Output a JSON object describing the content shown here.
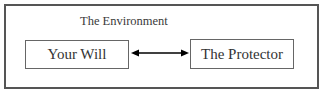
{
  "diagram": {
    "container": {
      "label": "The Environment"
    },
    "nodes": [
      {
        "id": "your-will",
        "label": "Your Will"
      },
      {
        "id": "the-protector",
        "label": "The Protector"
      }
    ],
    "edges": [
      {
        "from": "your-will",
        "to": "the-protector",
        "direction": "bidirectional"
      }
    ],
    "colors": {
      "border": "#555555",
      "text": "#333333",
      "arrow": "#000000"
    }
  }
}
